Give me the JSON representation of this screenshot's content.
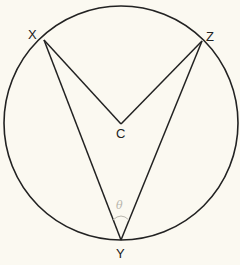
{
  "diagram": {
    "type": "circle-geometry",
    "colors": {
      "background": "#fbf9f1",
      "stroke": "#222222",
      "pencil": "#b9b6ad"
    },
    "circle": {
      "center_label": "C",
      "cx": 121,
      "cy": 123,
      "r": 117
    },
    "points": {
      "X": {
        "label": "X",
        "x": 44,
        "y": 40
      },
      "Z": {
        "label": "Z",
        "x": 202,
        "y": 41
      },
      "C": {
        "label": "C",
        "x": 121,
        "y": 124
      },
      "Y": {
        "label": "Y",
        "x": 121,
        "y": 240
      }
    },
    "segments": [
      {
        "from": "X",
        "to": "Y"
      },
      {
        "from": "Z",
        "to": "Y"
      },
      {
        "from": "X",
        "to": "C"
      },
      {
        "from": "Z",
        "to": "C"
      }
    ],
    "annotations": {
      "angle_at_Y_mark": "arc",
      "pencil_note": "θ"
    }
  }
}
